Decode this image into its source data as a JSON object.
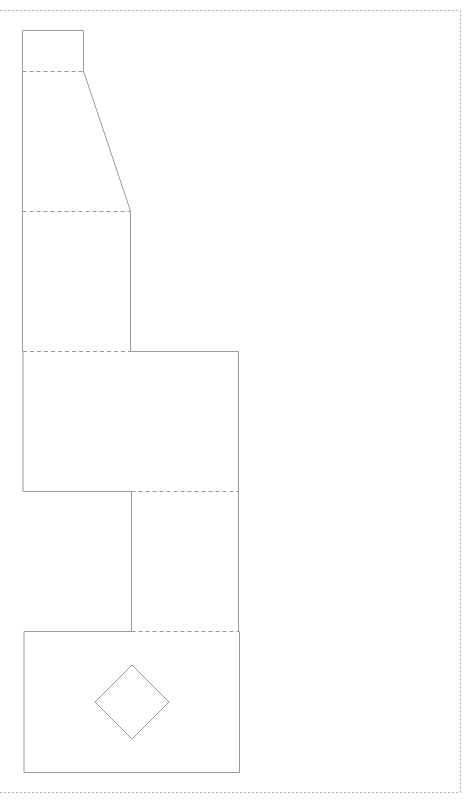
{
  "diagram": {
    "type": "papercraft-net",
    "colors": {
      "background": "#ffffff",
      "cut_line": "#9a9a9a",
      "fold_line": "#9a9a9a",
      "border": "#b0b0b0"
    },
    "legend": {
      "solid": "cut line",
      "dashed": "fold line"
    }
  }
}
